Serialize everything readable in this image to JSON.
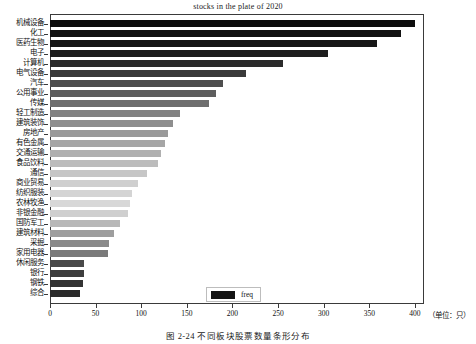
{
  "chart_data": {
    "type": "bar",
    "orientation": "horizontal",
    "title": "stocks in the plate of 2020",
    "xlabel": "",
    "ylabel": "",
    "unit_note": "（单位：只）",
    "xlim": [
      0,
      410
    ],
    "xticks": [
      0,
      50,
      100,
      150,
      200,
      250,
      300,
      350,
      400
    ],
    "xticklabels": [
      "0",
      "50",
      "100",
      "150",
      "200",
      "250",
      "300",
      "350",
      "400"
    ],
    "grid": false,
    "legend": {
      "position": "lower center",
      "entries": [
        "freq"
      ]
    },
    "series_name": "freq",
    "categories": [
      "机械设备",
      "化工",
      "医药生物",
      "电子",
      "计算机",
      "电气设备",
      "汽车",
      "公用事业",
      "传媒",
      "轻工制造",
      "建筑装饰",
      "房地产",
      "有色金属",
      "交通运输",
      "食品饮料",
      "通信",
      "商业贸易",
      "纺织服装",
      "农林牧渔",
      "非银金融",
      "国防军工",
      "建筑材料",
      "采掘",
      "家用电器",
      "休闲服务",
      "银行",
      "钢铁",
      "综合"
    ],
    "values": [
      400,
      385,
      358,
      305,
      255,
      215,
      190,
      182,
      174,
      142,
      135,
      129,
      126,
      122,
      118,
      106,
      97,
      90,
      88,
      86,
      77,
      70,
      65,
      64,
      37,
      37,
      36,
      33
    ],
    "bar_colors": [
      "#0d0d0d",
      "#121212",
      "#171717",
      "#1e1e1e",
      "#2b2b2b",
      "#3a3a3a",
      "#4e4e4e",
      "#5e5e5e",
      "#6e6e6e",
      "#828282",
      "#8e8e8e",
      "#9a9a9a",
      "#a6a6a6",
      "#b0b0b0",
      "#bcbcbc",
      "#c6c6c6",
      "#cfcfcf",
      "#d4d4d4",
      "#d8d8d8",
      "#cfcfcf",
      "#b8b8b8",
      "#9e9e9e",
      "#8a8a8a",
      "#7a7a7a",
      "#4a4a4a",
      "#3e3e3e",
      "#343434",
      "#2b2b2b"
    ]
  },
  "caption": {
    "text": "图 2-24    不同板块股票数量条形分布"
  },
  "legend": {
    "label": "freq"
  },
  "axes": {
    "unit": "（单位：只）"
  }
}
